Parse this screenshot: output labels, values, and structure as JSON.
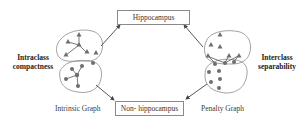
{
  "diagram": {
    "top_box": {
      "label": "Hippocampus"
    },
    "bottom_box": {
      "label": "Non- hippocampus"
    },
    "left_annotation": {
      "line1": "Intraclass",
      "line2": "compactness"
    },
    "right_annotation": {
      "line1": "Interclass",
      "line2": "separability"
    },
    "left_caption": "Intrinsic Graph",
    "right_caption": "Penalty Graph",
    "colors": {
      "node_fill": "#6e6e6e",
      "edge": "#555555",
      "blob_stroke": "#8c8c8c",
      "arrow": "#444444"
    },
    "legend": {
      "triangle_class": "hippocampus samples",
      "circle_class": "non-hippocampus samples"
    }
  }
}
